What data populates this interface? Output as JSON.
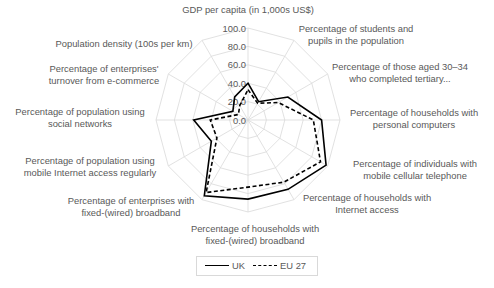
{
  "chart_data": {
    "type": "radar",
    "title": "",
    "categories": [
      "GDP per capita (in 1,000s US$)",
      "Percentage of students and pupils in the population",
      "Percentage of those aged 30–34 who completed tertiary...",
      "Percentage of households with personal computers",
      "Percentage of individuals with mobile cellular telephone",
      "Percentage of households with Internet access",
      "Percentage of households with fixed-(wired) broadband",
      "Percentage of enterprises with fixed-(wired) broadband",
      "Percentage of population using mobile Internet access regularly",
      "Percentage of population using social networks",
      "Percentage of enterprises' turnover from e-commerce",
      "Population density (100s per km)"
    ],
    "category_label_lines": [
      [
        "GDP per capita (in 1,000s US$)"
      ],
      [
        "Percentage of students and",
        "pupils in the population"
      ],
      [
        "Percentage of those aged 30–34",
        "who completed tertiary..."
      ],
      [
        "Percentage of households with",
        "personal computers"
      ],
      [
        "Percentage of individuals with",
        "mobile cellular telephone"
      ],
      [
        "Percentage of households with",
        "Internet access"
      ],
      [
        "Percentage of households with",
        "fixed-(wired) broadband"
      ],
      [
        "Percentage of enterprises with",
        "fixed-(wired) broadband"
      ],
      [
        "Percentage of population using",
        "mobile Internet access regularly"
      ],
      [
        "Percentage of population using",
        "social networks"
      ],
      [
        "Percentage of enterprises'",
        "turnover from e-commerce"
      ],
      [
        "Population density (100s per km)"
      ]
    ],
    "series": [
      {
        "name": "UK",
        "style": "solid",
        "color": "#000000",
        "values": [
          40,
          23,
          50,
          80,
          98,
          87,
          86,
          95,
          46,
          59,
          19,
          29
        ]
      },
      {
        "name": "EU 27",
        "style": "dashed",
        "color": "#000000",
        "values": [
          33,
          21,
          38,
          71,
          91,
          78,
          73,
          91,
          39,
          41,
          12,
          18
        ]
      }
    ],
    "radial_ticks": [
      "0.0",
      "20.0",
      "40.0",
      "60.0",
      "80.0",
      "100.0"
    ],
    "rlim": [
      0,
      100
    ],
    "grid": true,
    "legend_position": "bottom"
  },
  "legend": {
    "items": [
      {
        "label": "UK"
      },
      {
        "label": "EU 27"
      }
    ]
  }
}
